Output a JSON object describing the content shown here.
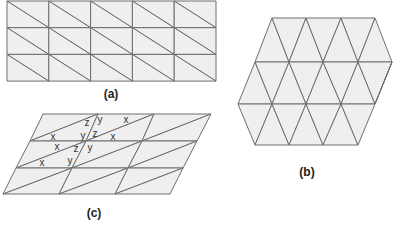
{
  "colors": {
    "fill": "#efefef",
    "stroke": "#6e6e6e",
    "background": "#ffffff"
  },
  "panels": [
    {
      "id": "a",
      "label": "(a)",
      "type": "rect-grid-diagonal",
      "description": "Rectangular 5x3 grid, each cell split by diagonal from top-left to bottom-right",
      "origin": [
        7,
        1
      ],
      "cols": 5,
      "rows": 3,
      "cell_w": 41.8,
      "cell_h": 26.7,
      "diagonal": "tl-br",
      "label_pos": [
        111,
        94
      ]
    },
    {
      "id": "b",
      "label": "(b)",
      "type": "hex-triangular",
      "description": "Hexagon tiled with equilateral-style triangles in 3 rows",
      "rows": [
        {
          "y_top": 18,
          "y_bot": 62,
          "top_x": [
            272,
            306,
            341,
            375
          ],
          "bot_x": [
            255,
            289,
            323,
            358,
            392
          ]
        },
        {
          "y_top": 62,
          "y_bot": 104,
          "top_x": [
            255,
            289,
            323,
            358,
            392
          ],
          "bot_x": [
            238,
            272,
            306,
            341,
            375
          ]
        },
        {
          "y_top": 104,
          "y_bot": 145,
          "top_x": [
            238,
            272,
            306,
            341,
            375
          ],
          "bot_x": [
            255,
            289,
            323,
            358
          ]
        }
      ],
      "label_pos": [
        307,
        172
      ]
    },
    {
      "id": "c",
      "label": "(c)",
      "type": "parallelogram-grid-diagonal",
      "description": "Sheared 3x3 grid, each cell split by diagonal from bottom-left to top-right; angle labels x, y, z",
      "row_lines": [
        {
          "y": 114,
          "x": [
            43,
            98,
            154,
            211
          ]
        },
        {
          "y": 141,
          "x": [
            30,
            86,
            142,
            197
          ]
        },
        {
          "y": 168,
          "x": [
            16,
            72,
            128,
            183
          ]
        },
        {
          "y": 194,
          "x": [
            3,
            59,
            115,
            170
          ]
        }
      ],
      "diagonal": "bl-tr",
      "angle_labels": [
        {
          "text": "z",
          "pos": [
            87,
            123
          ]
        },
        {
          "text": "y",
          "pos": [
            100,
            120
          ]
        },
        {
          "text": "x",
          "pos": [
            126,
            120
          ]
        },
        {
          "text": "x",
          "pos": [
            53,
            137
          ]
        },
        {
          "text": "y",
          "pos": [
            83,
            136
          ]
        },
        {
          "text": "z",
          "pos": [
            95,
            134
          ]
        },
        {
          "text": "x",
          "pos": [
            113,
            137
          ]
        },
        {
          "text": "x",
          "pos": [
            57,
            147
          ]
        },
        {
          "text": "z",
          "pos": [
            76,
            149
          ]
        },
        {
          "text": "y",
          "pos": [
            90,
            148
          ]
        },
        {
          "text": "x",
          "pos": [
            42,
            163
          ]
        },
        {
          "text": "y",
          "pos": [
            70,
            161
          ]
        }
      ],
      "label_pos": [
        94,
        213
      ]
    }
  ]
}
